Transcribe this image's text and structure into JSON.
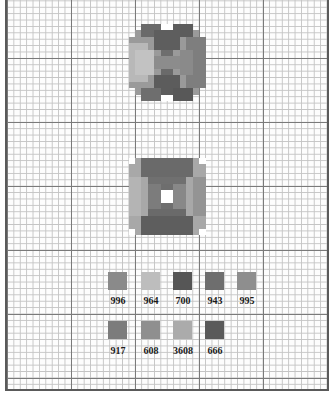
{
  "chart_title": "",
  "grid": {
    "cell_px": 6.4,
    "major_every": 10
  },
  "motifs": [
    {
      "name": "motif-x-block",
      "description": "square motif with dark X shape over lighter quadrants"
    },
    {
      "name": "motif-hourglass-block",
      "description": "square motif with dark hourglass shape and white center"
    }
  ],
  "legend": {
    "row1": [
      {
        "code": "996",
        "color": "#8a8a8a"
      },
      {
        "code": "964",
        "color": "#bdbdbd"
      },
      {
        "code": "700",
        "color": "#565656"
      },
      {
        "code": "943",
        "color": "#6e6e6e"
      },
      {
        "code": "995",
        "color": "#8e8e8e"
      }
    ],
    "row2": [
      {
        "code": "917",
        "color": "#7c7c7c"
      },
      {
        "code": "608",
        "color": "#8f8f8f"
      },
      {
        "code": "3608",
        "color": "#ababab"
      },
      {
        "code": "666",
        "color": "#5a5a5a"
      }
    ]
  }
}
